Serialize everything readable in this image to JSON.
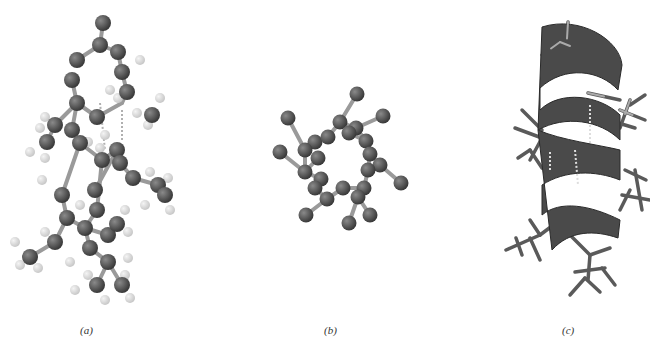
{
  "figure": {
    "panels": [
      {
        "id": "a",
        "label": "(a)",
        "description": "ball-and-stick alpha helix side view",
        "caption_x": 80
      },
      {
        "id": "b",
        "label": "(b)",
        "description": "alpha helix backbone viewed down axis",
        "caption_x": 104
      },
      {
        "id": "c",
        "label": "(c)",
        "description": "ribbon model of alpha helix with side chains",
        "caption_x": 108
      }
    ]
  },
  "colors": {
    "atom_heavy": "#3a3a3a",
    "atom_heavy_highlight": "#8a8a8a",
    "atom_hydrogen": "#c8c8c8",
    "bond": "#9a9a9a",
    "hbond": "#b0b0b0",
    "ribbon": "#4a4a4a",
    "ribbon_dark": "#2a2a2a",
    "stick": "#5a5a5a",
    "stick_light": "#aaaaaa"
  },
  "model_a": {
    "heavy": [
      [
        103,
        23
      ],
      [
        100,
        45
      ],
      [
        77,
        60
      ],
      [
        118,
        52
      ],
      [
        122,
        72
      ],
      [
        127,
        92
      ],
      [
        72,
        80
      ],
      [
        77,
        103
      ],
      [
        97,
        117
      ],
      [
        55,
        125
      ],
      [
        47,
        142
      ],
      [
        72,
        130
      ],
      [
        80,
        143
      ],
      [
        102,
        160
      ],
      [
        117,
        150
      ],
      [
        120,
        163
      ],
      [
        152,
        115
      ],
      [
        133,
        178
      ],
      [
        158,
        185
      ],
      [
        62,
        195
      ],
      [
        67,
        218
      ],
      [
        85,
        228
      ],
      [
        97,
        210
      ],
      [
        108,
        235
      ],
      [
        117,
        224
      ],
      [
        55,
        242
      ],
      [
        30,
        257
      ],
      [
        90,
        248
      ],
      [
        108,
        262
      ],
      [
        97,
        285
      ],
      [
        122,
        285
      ],
      [
        165,
        195
      ],
      [
        95,
        190
      ]
    ],
    "hydrogen": [
      [
        140,
        60
      ],
      [
        110,
        90
      ],
      [
        118,
        98
      ],
      [
        137,
        113
      ],
      [
        148,
        125
      ],
      [
        160,
        98
      ],
      [
        45,
        117
      ],
      [
        40,
        128
      ],
      [
        30,
        152
      ],
      [
        45,
        158
      ],
      [
        42,
        180
      ],
      [
        88,
        142
      ],
      [
        100,
        148
      ],
      [
        105,
        135
      ],
      [
        150,
        172
      ],
      [
        168,
        178
      ],
      [
        145,
        205
      ],
      [
        170,
        210
      ],
      [
        125,
        210
      ],
      [
        128,
        232
      ],
      [
        80,
        205
      ],
      [
        45,
        232
      ],
      [
        15,
        242
      ],
      [
        20,
        265
      ],
      [
        38,
        268
      ],
      [
        70,
        262
      ],
      [
        88,
        275
      ],
      [
        75,
        290
      ],
      [
        128,
        258
      ],
      [
        125,
        275
      ],
      [
        130,
        298
      ],
      [
        105,
        300
      ]
    ],
    "bonds": [
      [
        103,
        23,
        100,
        45
      ],
      [
        100,
        45,
        77,
        60
      ],
      [
        100,
        45,
        118,
        52
      ],
      [
        118,
        52,
        122,
        72
      ],
      [
        122,
        72,
        127,
        92
      ],
      [
        72,
        80,
        77,
        103
      ],
      [
        77,
        103,
        97,
        117
      ],
      [
        97,
        117,
        122,
        103
      ],
      [
        122,
        103,
        127,
        92
      ],
      [
        77,
        103,
        55,
        125
      ],
      [
        55,
        125,
        47,
        142
      ],
      [
        77,
        103,
        72,
        130
      ],
      [
        72,
        130,
        80,
        143
      ],
      [
        80,
        143,
        102,
        160
      ],
      [
        102,
        160,
        117,
        150
      ],
      [
        117,
        150,
        120,
        163
      ],
      [
        120,
        163,
        133,
        178
      ],
      [
        133,
        178,
        158,
        185
      ],
      [
        158,
        185,
        165,
        195
      ],
      [
        80,
        143,
        62,
        195
      ],
      [
        62,
        195,
        67,
        218
      ],
      [
        67,
        218,
        85,
        228
      ],
      [
        85,
        228,
        97,
        210
      ],
      [
        97,
        210,
        102,
        160
      ],
      [
        85,
        228,
        108,
        235
      ],
      [
        108,
        235,
        117,
        224
      ],
      [
        67,
        218,
        55,
        242
      ],
      [
        55,
        242,
        30,
        257
      ],
      [
        85,
        228,
        90,
        248
      ],
      [
        90,
        248,
        108,
        262
      ],
      [
        108,
        262,
        97,
        285
      ],
      [
        108,
        262,
        122,
        285
      ],
      [
        117,
        150,
        95,
        190
      ]
    ],
    "hbonds": [
      [
        100,
        103,
        105,
        150
      ],
      [
        122,
        110,
        122,
        140
      ]
    ]
  },
  "model_b": {
    "atoms": [
      [
        127,
        14
      ],
      [
        58,
        38
      ],
      [
        153,
        36
      ],
      [
        110,
        42
      ],
      [
        126,
        48
      ],
      [
        85,
        62
      ],
      [
        98,
        57
      ],
      [
        75,
        70
      ],
      [
        119,
        53
      ],
      [
        136,
        61
      ],
      [
        50,
        72
      ],
      [
        88,
        78
      ],
      [
        140,
        74
      ],
      [
        150,
        85
      ],
      [
        75,
        92
      ],
      [
        91,
        99
      ],
      [
        138,
        90
      ],
      [
        171,
        103
      ],
      [
        85,
        108
      ],
      [
        113,
        108
      ],
      [
        134,
        108
      ],
      [
        97,
        119
      ],
      [
        128,
        117
      ],
      [
        76,
        135
      ],
      [
        140,
        135
      ],
      [
        119,
        143
      ]
    ],
    "bonds": [
      [
        127,
        14,
        110,
        42
      ],
      [
        58,
        38,
        75,
        70
      ],
      [
        153,
        36,
        126,
        48
      ],
      [
        110,
        42,
        126,
        48
      ],
      [
        110,
        42,
        98,
        57
      ],
      [
        98,
        57,
        85,
        62
      ],
      [
        85,
        62,
        75,
        70
      ],
      [
        126,
        48,
        136,
        61
      ],
      [
        136,
        61,
        140,
        74
      ],
      [
        140,
        74,
        150,
        85
      ],
      [
        150,
        85,
        171,
        103
      ],
      [
        50,
        72,
        75,
        92
      ],
      [
        75,
        70,
        75,
        92
      ],
      [
        75,
        92,
        91,
        99
      ],
      [
        91,
        99,
        85,
        108
      ],
      [
        85,
        108,
        97,
        119
      ],
      [
        97,
        119,
        113,
        108
      ],
      [
        113,
        108,
        134,
        108
      ],
      [
        134,
        108,
        138,
        90
      ],
      [
        138,
        90,
        140,
        74
      ],
      [
        97,
        119,
        76,
        135
      ],
      [
        128,
        117,
        140,
        135
      ],
      [
        128,
        117,
        119,
        143
      ],
      [
        134,
        108,
        128,
        117
      ],
      [
        88,
        78,
        75,
        92
      ],
      [
        119,
        53,
        136,
        61
      ]
    ]
  },
  "model_c": {
    "ribbon_segments": [
      {
        "d": "M 72 17 C 110 5, 150 30, 152 55 L 148 80 C 130 60, 95 55, 70 78 L 70 100 C 90 80, 130 85, 150 105 L 150 130 C 130 110, 95 105, 68 120 Z"
      },
      {
        "d": "M 68 120 C 90 130, 130 135, 150 140 L 150 170 C 125 160, 95 160, 72 175 L 72 205 C 90 190, 120 195, 150 210 L 148 228 C 125 220, 100 220, 82 240 Z"
      }
    ],
    "sticks": [
      [
        98,
        12,
        96,
        45
      ],
      [
        90,
        32,
        110,
        40
      ],
      [
        90,
        32,
        72,
        45
      ],
      [
        118,
        83,
        150,
        90
      ],
      [
        160,
        90,
        150,
        118
      ],
      [
        150,
        100,
        175,
        110
      ],
      [
        160,
        95,
        175,
        85
      ],
      [
        145,
        112,
        165,
        118
      ],
      [
        52,
        100,
        72,
        120
      ],
      [
        45,
        118,
        72,
        128
      ],
      [
        72,
        128,
        60,
        150
      ],
      [
        60,
        140,
        48,
        148
      ],
      [
        60,
        140,
        72,
        158
      ],
      [
        78,
        140,
        95,
        162
      ],
      [
        155,
        160,
        176,
        170
      ],
      [
        165,
        160,
        172,
        200
      ],
      [
        152,
        185,
        180,
        190
      ],
      [
        160,
        180,
        150,
        200
      ],
      [
        36,
        240,
        70,
        225
      ],
      [
        46,
        228,
        52,
        245
      ],
      [
        60,
        228,
        70,
        250
      ],
      [
        70,
        225,
        90,
        210
      ],
      [
        70,
        225,
        60,
        210
      ],
      [
        100,
        225,
        120,
        245
      ],
      [
        120,
        245,
        118,
        270
      ],
      [
        105,
        262,
        135,
        258
      ],
      [
        120,
        245,
        140,
        238
      ],
      [
        115,
        268,
        100,
        285
      ],
      [
        115,
        268,
        130,
        282
      ],
      [
        132,
        258,
        145,
        275
      ]
    ],
    "hbonds": [
      [
        120,
        95,
        120,
        135
      ],
      [
        80,
        142,
        80,
        160
      ],
      [
        105,
        140,
        108,
        175
      ]
    ]
  }
}
